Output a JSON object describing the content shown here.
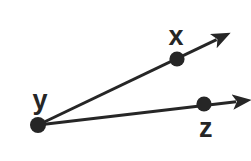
{
  "figure": {
    "background_color": "#ffffff",
    "ink_color": "#262626",
    "stroke_width": 3,
    "dot_radius": 7
  },
  "labels": {
    "x": "x",
    "y": "y",
    "z": "z"
  },
  "chart_data": {
    "type": "scatter",
    "xlabel": "",
    "ylabel": "",
    "xlim": [
      0,
      251
    ],
    "ylim": [
      161,
      0
    ],
    "grid": false,
    "legend": "none",
    "points": [
      {
        "label": "y",
        "x": 38,
        "y": 125,
        "role": "vertex",
        "dot": true,
        "label_x": 40,
        "label_y": 100
      },
      {
        "label": "x",
        "x": 177,
        "y": 59,
        "role": "ray-point",
        "dot": true,
        "label_x": 176,
        "label_y": 36
      },
      {
        "label": "z",
        "x": 204,
        "y": 104,
        "role": "ray-point",
        "dot": true,
        "label_x": 206,
        "label_y": 128
      }
    ],
    "rays": [
      {
        "name": "ray-yx",
        "from": "y",
        "through": "x",
        "start": [
          38,
          125
        ],
        "tip": [
          222,
          37
        ],
        "arrow": true
      },
      {
        "name": "ray-yz",
        "from": "y",
        "through": "z",
        "start": [
          38,
          125
        ],
        "tip": [
          242,
          101
        ],
        "arrow": true
      }
    ],
    "annotations": []
  }
}
